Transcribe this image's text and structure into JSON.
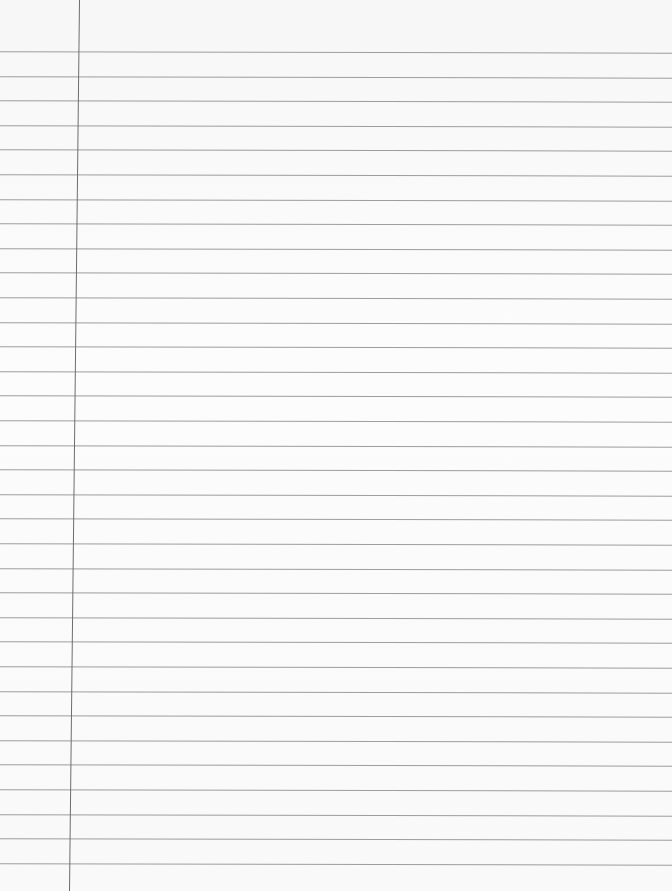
{
  "paper": {
    "type": "lined-notebook-page",
    "rule_color": "#8d8d8d",
    "margin_color": "#6d6d6d",
    "background": "#fbfbfb",
    "first_rule_y": 52,
    "rule_spacing": 24.6,
    "rule_count": 34,
    "margin_x_top": 79,
    "margin_x_bottom": 69
  }
}
